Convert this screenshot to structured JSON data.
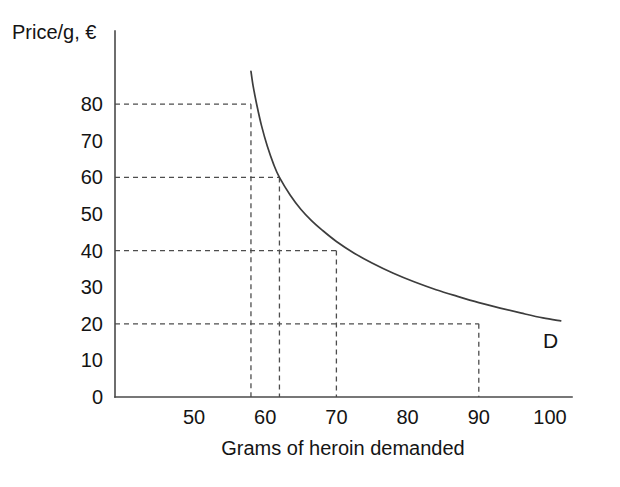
{
  "figure": {
    "background_color": "#ffffff",
    "line_color": "#3d3d3d",
    "guide_color": "#4d4d4d",
    "axis_color": "#4a4a4a",
    "text_color": "#141414",
    "curve_label": "D",
    "caption_partial": ""
  },
  "chart_data": {
    "type": "line",
    "title": "",
    "subtitle": "",
    "xlabel": "Grams of heroin demanded",
    "ylabel": "Price/g, €",
    "xlim": [
      40,
      103
    ],
    "ylim": [
      0,
      92
    ],
    "grid": false,
    "legend": [
      {
        "name": "D",
        "description": "Demand curve for heroin"
      }
    ],
    "legend_position": "inline-right-end",
    "xticks": [
      50,
      60,
      70,
      80,
      90,
      100
    ],
    "xticklabels": [
      "50",
      "60",
      "70",
      "80",
      "90",
      "100"
    ],
    "yticks": [
      0,
      10,
      20,
      30,
      40,
      50,
      60,
      70,
      80
    ],
    "yticklabels": [
      "0",
      "10",
      "20",
      "30",
      "40",
      "50",
      "60",
      "70",
      "80"
    ],
    "series": [
      {
        "name": "D",
        "label": "Demand",
        "x": [
          58.0,
          58.3,
          58.8,
          59.5,
          60.3,
          61.2,
          62.0,
          63.5,
          65.0,
          66.5,
          68.0,
          70.0,
          72.5,
          75.0,
          78.0,
          81.0,
          84.0,
          87.0,
          90.0,
          93.0,
          96.0,
          99.0,
          101.5
        ],
        "y": [
          89.0,
          85.0,
          80.0,
          74.0,
          68.5,
          63.5,
          60.0,
          55.2,
          51.3,
          48.2,
          45.6,
          42.5,
          39.3,
          36.6,
          33.8,
          31.4,
          29.3,
          27.5,
          25.8,
          24.3,
          22.9,
          21.6,
          20.8
        ]
      }
    ],
    "annotations": [
      {
        "price": 80,
        "quantity": 58,
        "note": "Price 80 €/g → 58 grams demanded"
      },
      {
        "price": 60,
        "quantity": 62,
        "note": "Price 60 €/g → 62 grams demanded"
      },
      {
        "price": 40,
        "quantity": 70,
        "note": "Price 40 €/g → 70 grams demanded"
      },
      {
        "price": 20,
        "quantity": 90,
        "note": "Price 20 €/g → 90 grams demanded"
      }
    ],
    "guide_levels": [
      80,
      60,
      40,
      20
    ],
    "guide_quantities": [
      58,
      62,
      70,
      90
    ]
  }
}
